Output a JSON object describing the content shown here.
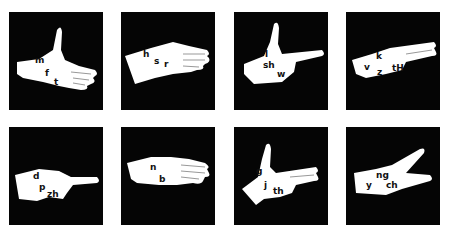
{
  "figure": {
    "background_color": "#050505",
    "hand_color": "#ffffff",
    "panels": [
      {
        "id": 1,
        "row": 1,
        "col": 1,
        "shape": "open hand with thumb up",
        "labels": [
          "m",
          "f",
          "t"
        ]
      },
      {
        "id": 2,
        "row": 1,
        "col": 2,
        "shape": "flat hand, fingers together",
        "labels": [
          "h",
          "s",
          "r"
        ]
      },
      {
        "id": 3,
        "row": 1,
        "col": 3,
        "shape": "index finger pointing with thumb up",
        "labels": [
          "l",
          "sh",
          "w"
        ]
      },
      {
        "id": 4,
        "row": 1,
        "col": 4,
        "shape": "two fingers extended together",
        "labels": [
          "k",
          "v",
          "z",
          "tH"
        ]
      },
      {
        "id": 5,
        "row": 2,
        "col": 1,
        "shape": "index finger pointing",
        "labels": [
          "d",
          "p",
          "zh"
        ]
      },
      {
        "id": 6,
        "row": 2,
        "col": 2,
        "shape": "four fingers extended",
        "labels": [
          "n",
          "b"
        ]
      },
      {
        "id": 7,
        "row": 2,
        "col": 3,
        "shape": "two fingers extended with thumb up",
        "labels": [
          "g",
          "j",
          "th"
        ]
      },
      {
        "id": 8,
        "row": 2,
        "col": 4,
        "shape": "two fingers spread in V",
        "labels": [
          "ng",
          "y",
          "ch"
        ]
      }
    ]
  }
}
